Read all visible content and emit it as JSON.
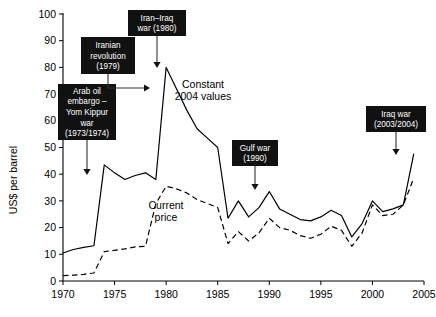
{
  "chart_data": {
    "type": "line",
    "title": "",
    "xlabel": "",
    "ylabel": "US$ per barrel",
    "xlim": [
      1970,
      2005
    ],
    "ylim": [
      0,
      100
    ],
    "grid": false,
    "legend_position": "inline-labels",
    "x_ticks": [
      "1970",
      "1975",
      "1980",
      "1985",
      "1990",
      "1995",
      "2000",
      "2005"
    ],
    "y_ticks": [
      "0",
      "10",
      "20",
      "30",
      "40",
      "50",
      "60",
      "70",
      "80",
      "90",
      "100"
    ],
    "x": [
      1970,
      1971,
      1972,
      1973,
      1974,
      1975,
      1976,
      1977,
      1978,
      1979,
      1980,
      1981,
      1982,
      1983,
      1984,
      1985,
      1986,
      1987,
      1988,
      1989,
      1990,
      1991,
      1992,
      1993,
      1994,
      1995,
      1996,
      1997,
      1998,
      1999,
      2000,
      2001,
      2002,
      2003,
      2004
    ],
    "series": [
      {
        "name": "Constant 2004 values",
        "style": "solid",
        "label": "Constant\n2004 values",
        "values": [
          10.5,
          11.8,
          12.6,
          13.2,
          43.5,
          40.5,
          38.0,
          39.5,
          40.5,
          38.0,
          80.0,
          72.0,
          64.0,
          57.0,
          53.5,
          50.0,
          23.5,
          30.0,
          24.0,
          27.5,
          33.5,
          27.0,
          25.0,
          23.0,
          22.5,
          24.0,
          26.5,
          24.5,
          16.5,
          21.5,
          30.0,
          26.0,
          27.0,
          28.5,
          47.5
        ]
      },
      {
        "name": "Current price",
        "style": "dashed",
        "label": "Current\nprice",
        "values": [
          2.0,
          2.2,
          2.5,
          3.0,
          11.0,
          11.5,
          12.0,
          12.8,
          13.0,
          29.0,
          35.5,
          34.5,
          33.0,
          30.5,
          29.0,
          27.5,
          14.0,
          18.5,
          15.0,
          18.0,
          23.5,
          20.0,
          19.0,
          17.0,
          16.0,
          17.5,
          20.5,
          19.0,
          13.0,
          18.0,
          28.5,
          24.5,
          25.0,
          28.5,
          38.5
        ]
      }
    ],
    "annotations": [
      {
        "id": "arab-oil-embargo",
        "lines": [
          "Arab oil",
          "embargo –",
          "Yom Kippur",
          "war",
          "(1973/1974)"
        ],
        "points_to_year": 1974
      },
      {
        "id": "iranian-revolution",
        "lines": [
          "Iranian",
          "revolution",
          "(1979)"
        ],
        "points_to_year": 1979
      },
      {
        "id": "iran-iraq-war",
        "lines": [
          "Iran–Iraq",
          "war (1980)"
        ],
        "points_to_year": 1980
      },
      {
        "id": "gulf-war",
        "lines": [
          "Gulf war",
          "(1990)"
        ],
        "points_to_year": 1990
      },
      {
        "id": "iraq-war",
        "lines": [
          "Iraq war",
          "(2003/2004)"
        ],
        "points_to_year": 2004
      }
    ]
  },
  "colors": {
    "background": "#ffffff",
    "ink": "#000000",
    "annotation_box": "#111111",
    "annotation_text": "#ffffff",
    "leader": "#333333"
  }
}
